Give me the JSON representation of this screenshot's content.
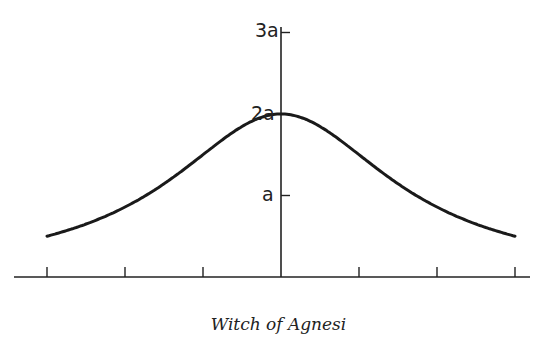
{
  "chart_data": {
    "type": "line",
    "title": "Witch of Agnesi",
    "equation": "y = 8a^3 / (x^2 + 4a^2)",
    "xlabel": "",
    "ylabel": "",
    "y_tick_labels": [
      "a",
      "2a",
      "3a"
    ],
    "y_ticks": [
      1,
      2,
      3
    ],
    "x_ticks": [
      -3,
      -2,
      -1,
      0,
      1,
      2,
      3
    ],
    "x_tick_labels": [],
    "xlim": [
      -3,
      3
    ],
    "ylim": [
      0,
      3
    ],
    "grid": false,
    "series": [
      {
        "name": "Witch of Agnesi",
        "x": [
          -3,
          -2.5,
          -2,
          -1.5,
          -1,
          -0.5,
          0,
          0.5,
          1,
          1.5,
          2,
          2.5,
          3
        ],
        "values": [
          0.31,
          0.78,
          1.0,
          1.28,
          1.6,
          1.88,
          2.0,
          1.88,
          1.6,
          1.28,
          1.0,
          0.78,
          0.31
        ]
      }
    ]
  },
  "labels": {
    "y3": "3a",
    "y2": "2a",
    "y1": "a"
  },
  "caption": "Witch of Agnesi"
}
